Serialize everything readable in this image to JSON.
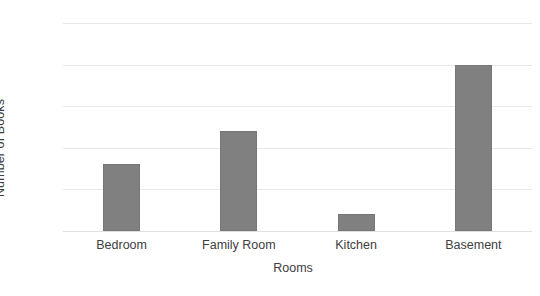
{
  "chart_data": {
    "type": "bar",
    "title": "",
    "subtitle": "",
    "categories": [
      "Bedroom",
      "Family Room",
      "Kitchen",
      "Basement"
    ],
    "values": [
      8,
      12,
      2,
      20
    ],
    "xlabel": "Rooms",
    "ylabel": "Number of Books",
    "ylim": [
      0,
      25
    ],
    "yticks": [
      0,
      5,
      10,
      15,
      20,
      25
    ],
    "ytick_labels": [
      "0",
      "5",
      "10",
      "15",
      "20",
      "25"
    ],
    "grid": "horizontal",
    "legend": null,
    "legend_position": "none",
    "annotations": [],
    "colors": {
      "bar_fill": "#808080",
      "bar_edge": "#767676",
      "gridline": "#e8e8e8",
      "text": "#404040",
      "background": "#ffffff"
    }
  }
}
